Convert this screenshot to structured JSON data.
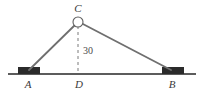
{
  "figure": {
    "type": "geometry-diagram",
    "colors": {
      "stroke": "#6f6f6f",
      "ground": "#5c5c5c",
      "support_fill": "#2b2b2b",
      "dashed": "#7a7a7a",
      "text": "#3a3a3a",
      "background": "#ffffff"
    },
    "points": {
      "A": {
        "label": "A",
        "x": 28,
        "y": 73,
        "label_x": 28,
        "label_y": 87
      },
      "B": {
        "label": "B",
        "x": 172,
        "y": 73,
        "label_x": 172,
        "label_y": 87
      },
      "C": {
        "label": "C",
        "x": 78,
        "y": 22,
        "label_x": 78,
        "label_y": 12
      },
      "D": {
        "label": "D",
        "x": 78,
        "y": 73,
        "label_x": 79,
        "label_y": 87
      }
    },
    "height_measure": {
      "label": "30",
      "label_x": 83,
      "label_y": 53,
      "from": "C",
      "to": "D"
    },
    "pulley": {
      "name": "pulley-circle",
      "cx": 78,
      "cy": 22,
      "r": 5
    },
    "ground_line": {
      "x1": 8,
      "x2": 196,
      "y": 74
    },
    "supports": [
      {
        "name": "support-block-a",
        "x": 18,
        "y": 67,
        "width": 22,
        "height": 7
      },
      {
        "name": "support-block-b",
        "x": 162,
        "y": 67,
        "width": 22,
        "height": 7
      }
    ]
  }
}
